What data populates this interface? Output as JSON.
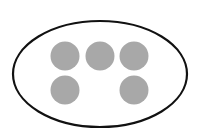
{
  "diagram": {
    "boundary": {
      "shape": "ellipse",
      "cx": 100,
      "cy": 74,
      "rx": 87,
      "ry": 53,
      "stroke": "#111111",
      "stroke_width": 2.2,
      "fill": "#ffffff"
    },
    "elements": [
      {
        "cx": 65,
        "cy": 56,
        "r": 14.5,
        "fill": "#a8a8a8"
      },
      {
        "cx": 100,
        "cy": 56,
        "r": 14.5,
        "fill": "#a8a8a8"
      },
      {
        "cx": 134,
        "cy": 56,
        "r": 14.5,
        "fill": "#a8a8a8"
      },
      {
        "cx": 65,
        "cy": 90,
        "r": 14.5,
        "fill": "#a8a8a8"
      },
      {
        "cx": 134,
        "cy": 90,
        "r": 14.5,
        "fill": "#a8a8a8"
      }
    ],
    "element_count": 5
  }
}
